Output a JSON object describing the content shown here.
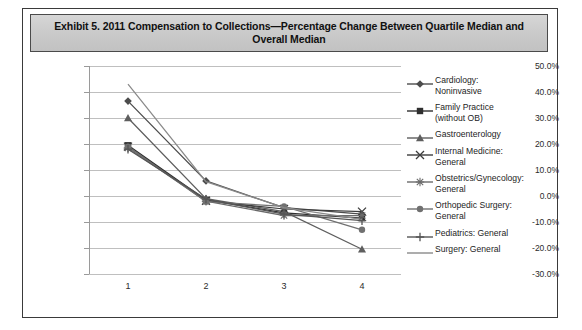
{
  "exhibit": {
    "title": "Exhibit 5. 2011 Compensation to Collections—Percentage Change Between Quartile Median and Overall Median"
  },
  "chart_data": {
    "type": "line",
    "title": "Exhibit 5. 2011 Compensation to Collections—Percentage Change Between Quartile Median and Overall Median",
    "xlabel": "",
    "ylabel": "",
    "categories": [
      "1",
      "2",
      "3",
      "4"
    ],
    "x": [
      1,
      2,
      3,
      4
    ],
    "xtick_labels": [
      "1",
      "2",
      "3",
      "4"
    ],
    "ytick_labels": [
      "50.0%",
      "40.0%",
      "30.0%",
      "20.0%",
      "10.0%",
      "0.0%",
      "-10.0%",
      "-20.0%",
      "-30.0%"
    ],
    "ytick_values": [
      50,
      40,
      30,
      20,
      10,
      0,
      -10,
      -20,
      -30
    ],
    "ylim": [
      -30,
      50
    ],
    "grid": true,
    "legend_position": "right",
    "units": "percent",
    "series": [
      {
        "name": "Cardiology: Noninvasive",
        "marker": "diamond",
        "color": "#4c4c4c",
        "values": [
          36.5,
          5.8,
          -4.5,
          -7.0
        ]
      },
      {
        "name": "Family Practice (without OB)",
        "marker": "square",
        "color": "#2f2f2f",
        "values": [
          19.5,
          -1.5,
          -6.5,
          -8.5
        ]
      },
      {
        "name": "Gastroenterology",
        "marker": "triangle",
        "color": "#5e5e5e",
        "values": [
          30.0,
          -1.0,
          -6.0,
          -20.5
        ]
      },
      {
        "name": "Internal Medicine: General",
        "marker": "x",
        "color": "#3b3b3b",
        "values": [
          19.0,
          -1.8,
          -5.0,
          -6.0
        ]
      },
      {
        "name": "Obstetrics/Gynecology: General",
        "marker": "star",
        "color": "#6a6a6a",
        "values": [
          18.5,
          -2.0,
          -7.5,
          -7.5
        ]
      },
      {
        "name": "Orthopedic Surgery: General",
        "marker": "circle",
        "color": "#707070",
        "values": [
          19.0,
          -2.2,
          -4.0,
          -13.0
        ]
      },
      {
        "name": "Pediatrics: General",
        "marker": "plus",
        "color": "#555555",
        "values": [
          18.0,
          -1.2,
          -7.0,
          -9.5
        ]
      },
      {
        "name": "Surgery: General",
        "marker": "none",
        "color": "#8a8a8a",
        "values": [
          43.0,
          5.5,
          -4.5,
          -9.0
        ]
      }
    ]
  },
  "legend": {
    "items": [
      {
        "label": "Cardiology:\nNoninvasive",
        "marker": "diamond-marker-icon"
      },
      {
        "label": "Family Practice\n(without OB)",
        "marker": "square-marker-icon"
      },
      {
        "label": "Gastroenterology",
        "marker": "triangle-marker-icon"
      },
      {
        "label": "Internal Medicine:\nGeneral",
        "marker": "x-marker-icon"
      },
      {
        "label": "Obstetrics/Gynecology:\nGeneral",
        "marker": "star-marker-icon"
      },
      {
        "label": "Orthopedic Surgery:\nGeneral",
        "marker": "circle-marker-icon"
      },
      {
        "label": "Pediatrics: General",
        "marker": "plus-marker-icon"
      },
      {
        "label": "Surgery: General",
        "marker": "line-marker-icon"
      }
    ]
  }
}
